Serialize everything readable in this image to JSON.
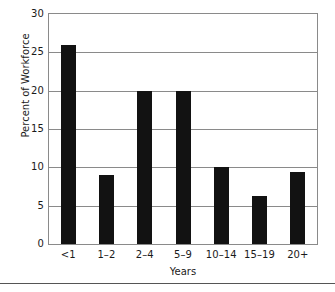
{
  "chart_data": {
    "type": "bar",
    "title": "",
    "subtitle": "",
    "xlabel": "Years",
    "ylabel": "Percent of Workforce",
    "categories": [
      "<1",
      "1–2",
      "2–4",
      "5–9",
      "10–14",
      "15–19",
      "20+"
    ],
    "values": [
      26,
      9,
      20,
      20,
      10,
      6.3,
      9.4
    ],
    "ylim": [
      0,
      30
    ],
    "yticks": [
      0,
      5,
      10,
      15,
      20,
      25,
      30
    ],
    "ytick_labels": [
      "0",
      "5",
      "10",
      "15",
      "20",
      "25",
      "30"
    ],
    "grid": true,
    "grid_axis": "y",
    "legend": false,
    "legend_position": "none",
    "bar_color": "#121212",
    "grid_color": "#8a8a8a",
    "frame_color": "#8a8a8a",
    "background_color": "#ffffff",
    "annotations": []
  },
  "figure": {
    "divider_color": "#555555"
  }
}
